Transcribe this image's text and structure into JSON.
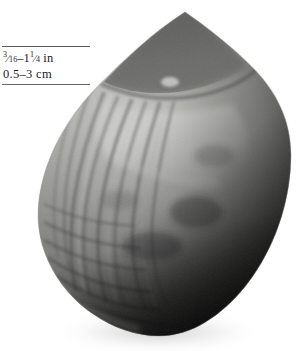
{
  "plate": {
    "subject": "bivalve-shell-specimen",
    "background_color": "#ffffff"
  },
  "caption": {
    "imperial_whole_fraction_num": "3",
    "imperial_whole_fraction_den": "16",
    "imperial_slash": "⁄",
    "imperial_dash": "–",
    "imperial_upper_whole": "1",
    "imperial_upper_num": "1",
    "imperial_upper_den": "4",
    "imperial_unit": "in",
    "imperial_full": "3/16–1¼ in",
    "metric_full": "0.5–3 cm",
    "metric_lower": "0.5",
    "metric_dash": "–",
    "metric_upper": "3",
    "metric_unit": "cm",
    "rule_color": "#4a4a4a",
    "text_color": "#1c1c1c"
  },
  "shell": {
    "name": "shell-photograph",
    "description": "grayscale photograph of an obliquely oval bivalve shell with pointed umbo at top, radial ribs on the left flank, concentric growth lines and deep shadow on the right",
    "apex_x": 185,
    "apex_y": 12,
    "left_edge_x": 38,
    "right_edge_x": 291,
    "bottom_y": 336,
    "highlight_color": "#d9d9d7",
    "midtone_color": "#8e8e8c",
    "shadow_color": "#17171a",
    "umbo_color": "#6d6d6b",
    "drop_shadow_color": "#cfcfcf"
  }
}
